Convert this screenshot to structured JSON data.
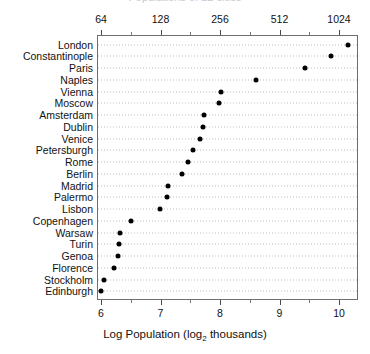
{
  "chart": {
    "title": "Populations of 22 cities",
    "xlabel_main": "Log Population (log",
    "xlabel_sub": "2",
    "xlabel_tail": " thousands)",
    "top_axis_ticks": [
      "64",
      "128",
      "256",
      "512",
      "1024"
    ],
    "bottom_axis_ticks": [
      "6",
      "7",
      "8",
      "9",
      "10"
    ]
  },
  "chart_data": {
    "type": "scatter",
    "title": "Populations of 22 cities",
    "xlabel": "Log Population (log_2 thousands)",
    "ylabel": "",
    "xlim": [
      5.93,
      10.32
    ],
    "grid": true,
    "legend": "none",
    "orientation": "horizontal-dotplot",
    "secondary_x_axis": {
      "label": "",
      "tick_labels": [
        "64",
        "128",
        "256",
        "512",
        "1024"
      ],
      "tick_values": [
        6,
        7,
        8,
        9,
        10
      ]
    },
    "x_axis": {
      "tick_labels": [
        "6",
        "7",
        "8",
        "9",
        "10"
      ],
      "tick_values": [
        6,
        7,
        8,
        9,
        10
      ],
      "minor_ticks": [
        6.5,
        7.5,
        8.5,
        9.5
      ]
    },
    "categories": [
      "London",
      "Constantinople",
      "Paris",
      "Naples",
      "Vienna",
      "Moscow",
      "Amsterdam",
      "Dublin",
      "Venice",
      "Petersburgh",
      "Rome",
      "Berlin",
      "Madrid",
      "Palermo",
      "Lisbon",
      "Copenhagen",
      "Warsaw",
      "Turin",
      "Genoa",
      "Florence",
      "Stockholm",
      "Edinburgh"
    ],
    "values": [
      10.15,
      9.87,
      9.43,
      8.61,
      8.01,
      7.98,
      7.73,
      7.71,
      7.66,
      7.55,
      7.46,
      7.36,
      7.13,
      7.11,
      6.99,
      6.5,
      6.32,
      6.3,
      6.29,
      6.22,
      6.05,
      6.0
    ],
    "value_units": "log2(thousands of inhabitants)"
  },
  "points": [
    {
      "label": "London",
      "value": 10.15
    },
    {
      "label": "Constantinople",
      "value": 9.87
    },
    {
      "label": "Paris",
      "value": 9.43
    },
    {
      "label": "Naples",
      "value": 8.61
    },
    {
      "label": "Vienna",
      "value": 8.01
    },
    {
      "label": "Moscow",
      "value": 7.98
    },
    {
      "label": "Amsterdam",
      "value": 7.73
    },
    {
      "label": "Dublin",
      "value": 7.71
    },
    {
      "label": "Venice",
      "value": 7.66
    },
    {
      "label": "Petersburgh",
      "value": 7.55
    },
    {
      "label": "Rome",
      "value": 7.46
    },
    {
      "label": "Berlin",
      "value": 7.36
    },
    {
      "label": "Madrid",
      "value": 7.13
    },
    {
      "label": "Palermo",
      "value": 7.11
    },
    {
      "label": "Lisbon",
      "value": 6.99
    },
    {
      "label": "Copenhagen",
      "value": 6.5
    },
    {
      "label": "Warsaw",
      "value": 6.32
    },
    {
      "label": "Turin",
      "value": 6.3
    },
    {
      "label": "Genoa",
      "value": 6.29
    },
    {
      "label": "Florence",
      "value": 6.22
    },
    {
      "label": "Stockholm",
      "value": 6.05
    },
    {
      "label": "Edinburgh",
      "value": 6.0
    }
  ]
}
